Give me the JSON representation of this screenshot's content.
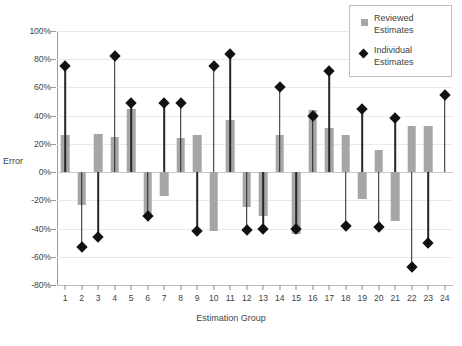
{
  "chart_data": {
    "type": "bar",
    "title": "",
    "xlabel": "Estimation Group",
    "ylabel": "Error",
    "ylim": [
      -80,
      100
    ],
    "ytick_step": 20,
    "grid": true,
    "legend_position": "top-right",
    "ytick_labels": [
      "100%",
      "80%",
      "60%",
      "40%",
      "20%",
      "0%",
      "-20%",
      "-40%",
      "-60%",
      "-80%"
    ],
    "ytick_values": [
      100,
      80,
      60,
      40,
      20,
      0,
      -20,
      -40,
      -60,
      -80
    ],
    "categories": [
      "1",
      "2",
      "3",
      "4",
      "5",
      "6",
      "7",
      "8",
      "9",
      "10",
      "11",
      "12",
      "13",
      "14",
      "15",
      "16",
      "17",
      "18",
      "19",
      "20",
      "21",
      "22",
      "23",
      "24"
    ],
    "series": [
      {
        "name": "Reviewed Estimates",
        "marker": "square",
        "color": "#a6a6a6",
        "values": [
          26,
          -23,
          27,
          25,
          45,
          -30,
          -17,
          24,
          26,
          -42,
          37,
          -25,
          -31,
          26,
          -44,
          44,
          31,
          26,
          -19,
          16,
          -35,
          33,
          33,
          0
        ]
      },
      {
        "name": "Individual Estimates",
        "marker": "diamond",
        "color": "#111111",
        "values": [
          75,
          -53,
          -46,
          82,
          49,
          -31,
          49,
          49,
          -42,
          75,
          84,
          -41,
          -40,
          60,
          -40,
          40,
          72,
          -38,
          45,
          -39,
          38,
          -67,
          -50,
          55
        ]
      }
    ]
  },
  "legend": {
    "entries": [
      {
        "label_line1": "Reviewed",
        "label_line2": "Estimates",
        "marker": "square"
      },
      {
        "label_line1": "Individual",
        "label_line2": "Estimates",
        "marker": "diamond"
      }
    ]
  },
  "axis": {
    "y_title": "Error",
    "x_title": "Estimation Group"
  }
}
